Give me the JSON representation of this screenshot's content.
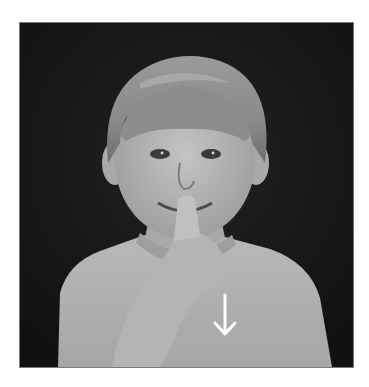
{
  "image": {
    "description": "Grayscale photograph of a young child with blond bowl-cut hair holding an index finger to the lips, with a white downward arrow drawn on the shirt, against a dark background",
    "subject": "child-sign-gesture",
    "annotation": {
      "type": "arrow",
      "direction": "down",
      "color": "#ffffff"
    },
    "colors": {
      "border": "#ffffff",
      "background": "#161616",
      "frame_line": "#7a7a7a"
    }
  }
}
